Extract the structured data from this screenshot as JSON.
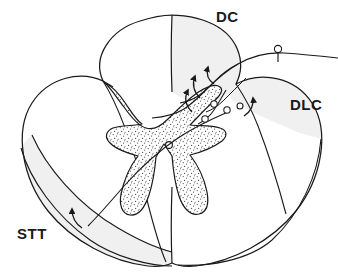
{
  "figure": {
    "title_visible": false,
    "background_color": "#ffffff",
    "stroke_color": "#1a1a1a",
    "gray_matter_fill": "#ffffff",
    "gray_matter_stipple_color": "#555555",
    "white_matter_shade_color": "#f0f0f0",
    "label_color": "#1a1a1a"
  },
  "labels": {
    "dorsal_column": "DC",
    "dorsolateral_column": "DLC",
    "spinothalamic_tract": "STT"
  },
  "structures": [
    {
      "name": "dorsal-column-tract",
      "abbrev": "DC",
      "shaded": true
    },
    {
      "name": "dorsolateral-column-tract",
      "abbrev": "DLC",
      "shaded": true
    },
    {
      "name": "spinothalamic-tract",
      "abbrev": "STT",
      "shaded": true
    },
    {
      "name": "gray-matter-butterfly",
      "abbrev": "",
      "shaded": false,
      "texture": "stipple"
    },
    {
      "name": "ventral-median-fissure",
      "abbrev": "",
      "shaded": false
    },
    {
      "name": "dorsal-median-sulcus",
      "abbrev": "",
      "shaded": false
    }
  ],
  "neurons": [
    {
      "name": "dorsal-root-ganglion-cell",
      "cx": 278,
      "cy": 49,
      "r": 3.4
    },
    {
      "name": "dorsal-horn-interneuron-1",
      "cx": 214,
      "cy": 104,
      "r": 3.2
    },
    {
      "name": "dorsal-horn-interneuron-2",
      "cx": 224,
      "cy": 110,
      "r": 3.2
    },
    {
      "name": "dorsal-horn-interneuron-3",
      "cx": 205,
      "cy": 118,
      "r": 3.2
    },
    {
      "name": "dorsal-horn-interneuron-4",
      "cx": 228,
      "cy": 111,
      "r": 3.2
    },
    {
      "name": "central-canal",
      "cx": 169,
      "cy": 145,
      "r": 3.4
    }
  ],
  "arrows": [
    {
      "name": "ascending-arrow-dorsal-column-medial",
      "direction": "up"
    },
    {
      "name": "ascending-arrow-dorsal-column-lateral",
      "direction": "up"
    },
    {
      "name": "ascending-arrow-dlc",
      "direction": "up"
    },
    {
      "name": "ascending-arrow-stt",
      "direction": "up"
    }
  ]
}
